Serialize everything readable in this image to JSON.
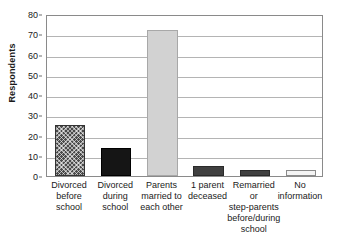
{
  "chart_data": {
    "type": "bar",
    "title": "",
    "subtitle": "",
    "xlabel": "",
    "ylabel": "Respondents",
    "ylim": [
      0,
      80
    ],
    "ytick_step": 10,
    "yticks": [
      0,
      10,
      20,
      30,
      40,
      50,
      60,
      70,
      80
    ],
    "grid": "horizontal",
    "legend": "none",
    "categories": [
      "Divorced before school",
      "Divorced during school",
      "Parents married to each other",
      "1 parent deceased",
      "Remarried or step-parents before/during school",
      "No information"
    ],
    "category_lines": [
      [
        "Divorced",
        "before",
        "school"
      ],
      [
        "Divorced",
        "during",
        "school"
      ],
      [
        "Parents",
        "married to",
        "each other"
      ],
      [
        "1 parent",
        "deceased"
      ],
      [
        "Remarried",
        "or",
        "step-parents",
        "before/during",
        "school"
      ],
      [
        "No",
        "information"
      ]
    ],
    "values": [
      25,
      14,
      72,
      5,
      3,
      3
    ],
    "bar_styles": [
      "crosshatch-dark-gray",
      "solid-black",
      "solid-light-gray",
      "solid-dark-gray",
      "solid-dark-gray",
      "outline-white"
    ],
    "colors": {
      "hatch": "#4a4a4a",
      "black": "#151515",
      "light_gray": "#d2d2d2",
      "dark_gray": "#404040",
      "white": "#f4f4f4",
      "gridline": "#b4b4b4",
      "frame": "#8a8a8a",
      "text": "#1a1a1a"
    }
  }
}
